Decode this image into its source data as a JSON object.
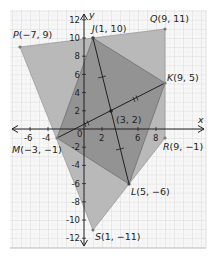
{
  "diagram": {
    "type": "coordinate-geometry",
    "axes": {
      "x_label": "x",
      "y_label": "y",
      "x_ticks": [
        "-6",
        "-4",
        "0",
        "2",
        "6",
        "8"
      ],
      "y_ticks": [
        "12",
        "10",
        "8",
        "6",
        "4",
        "2",
        "-2",
        "-4",
        "-6",
        "-8",
        "-10",
        "-12"
      ],
      "origin_label": "0"
    },
    "points": {
      "P": {
        "name": "P",
        "coords": "(−7, 9)",
        "x": -7,
        "y": 9
      },
      "Q": {
        "name": "Q",
        "coords": "(9, 11)",
        "x": 9,
        "y": 11
      },
      "J": {
        "name": "J",
        "coords": "(1, 10)",
        "x": 1,
        "y": 10
      },
      "K": {
        "name": "K",
        "coords": "(9, 5)",
        "x": 9,
        "y": 5
      },
      "L": {
        "name": "L",
        "coords": "(5, −6)",
        "x": 5,
        "y": -6
      },
      "M": {
        "name": "M",
        "coords": "(−3, −1)",
        "x": -3,
        "y": -1
      },
      "R": {
        "name": "R",
        "coords": "(9, −1)",
        "x": 9,
        "y": -1
      },
      "S": {
        "name": "S",
        "coords": "(1, −11)",
        "x": 1,
        "y": -11
      },
      "center": {
        "name": "",
        "coords": "(3, 2)",
        "x": 3,
        "y": 2
      }
    },
    "polygons": [
      {
        "name": "PQRS",
        "vertices": [
          "P",
          "Q",
          "R",
          "S"
        ],
        "fill": "#b3b3b3"
      },
      {
        "name": "JKLM",
        "vertices": [
          "J",
          "K",
          "L",
          "M"
        ],
        "fill": "#8c8c8c"
      }
    ],
    "diagonals": [
      {
        "from": "J",
        "to": "L",
        "tick_marks": 1
      },
      {
        "from": "M",
        "to": "K",
        "tick_marks": 2
      }
    ],
    "colors": {
      "grid": "#d9d9d9",
      "outer_fill": "#b5b5b5",
      "inner_fill": "#8f8f8f",
      "line": "#231f20",
      "point": "#7a7a7a"
    }
  }
}
